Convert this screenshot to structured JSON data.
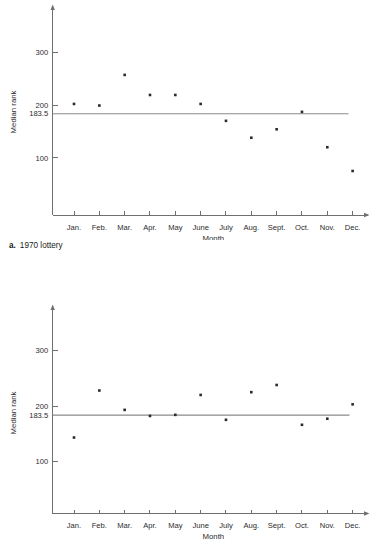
{
  "figure": {
    "caption_a_letter": "a.",
    "caption_a_text": "1970 lottery"
  },
  "axes": {
    "ylabel": "Median rank",
    "xlabel": "Month",
    "y_ticks": [
      "300",
      "200",
      "183.5",
      "100"
    ],
    "x_ticks": [
      "Jan.",
      "Feb.",
      "Mar.",
      "Apr.",
      "May",
      "June",
      "July",
      "Aug.",
      "Sept.",
      "Oct.",
      "Nov.",
      "Dec."
    ],
    "reference_value": "183.5",
    "colors": {
      "axis": "#6f6f6f",
      "point": "#2b2b2b",
      "reference_line": "#8a8a8a",
      "text": "#2b2b2b",
      "background": "#ffffff"
    }
  },
  "chart_data": [
    {
      "type": "scatter",
      "id": "chart-a",
      "title": "1970 lottery",
      "xlabel": "Month",
      "ylabel": "Median rank",
      "categories": [
        "Jan.",
        "Feb.",
        "Mar.",
        "Apr.",
        "May",
        "June",
        "July",
        "Aug.",
        "Sept.",
        "Oct.",
        "Nov.",
        "Dec."
      ],
      "values": [
        202,
        199,
        257,
        219,
        219,
        202,
        170,
        138,
        154,
        187,
        120,
        75
      ],
      "ylim": [
        0,
        380
      ],
      "yticks": [
        300,
        200,
        183.5,
        100
      ],
      "grid": false,
      "legend": "none",
      "annotations": [
        {
          "kind": "horizontal-reference-line",
          "value": 183.5,
          "label": "183.5"
        }
      ]
    },
    {
      "type": "scatter",
      "id": "chart-b",
      "title": "",
      "xlabel": "Month",
      "ylabel": "Median rank",
      "categories": [
        "Jan.",
        "Feb.",
        "Mar.",
        "Apr.",
        "May",
        "June",
        "July",
        "Aug.",
        "Sept.",
        "Oct.",
        "Nov.",
        "Dec."
      ],
      "values": [
        143,
        228,
        193,
        182,
        184,
        220,
        175,
        225,
        238,
        166,
        177,
        203
      ],
      "ylim": [
        0,
        380
      ],
      "yticks": [
        300,
        200,
        183.5,
        100
      ],
      "grid": false,
      "legend": "none",
      "annotations": [
        {
          "kind": "horizontal-reference-line",
          "value": 183.5,
          "label": "183.5"
        }
      ]
    }
  ]
}
